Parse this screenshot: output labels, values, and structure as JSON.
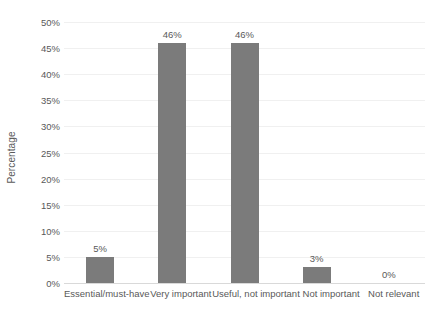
{
  "chart_data": {
    "type": "bar",
    "title": "",
    "xlabel": "",
    "ylabel": "Percentage",
    "categories": [
      "Essential/must-have",
      "Very important",
      "Useful, not important",
      "Not important",
      "Not relevant"
    ],
    "values": [
      5,
      46,
      46,
      3,
      0
    ],
    "value_labels": [
      "5%",
      "46%",
      "46%",
      "3%",
      "0%"
    ],
    "ylim": [
      0,
      50
    ],
    "ytick_values": [
      0,
      5,
      10,
      15,
      20,
      25,
      30,
      35,
      40,
      45,
      50
    ],
    "ytick_labels": [
      "0%",
      "5%",
      "10%",
      "15%",
      "20%",
      "25%",
      "30%",
      "35%",
      "40%",
      "45%",
      "50%"
    ],
    "grid": true,
    "legend": false,
    "legend_position": "none",
    "colors": {
      "bar": "#7b7b7b",
      "gridline": "#f0f0f0",
      "axis": "#d9d9d9",
      "text": "#595959",
      "background": "#ffffff"
    }
  }
}
